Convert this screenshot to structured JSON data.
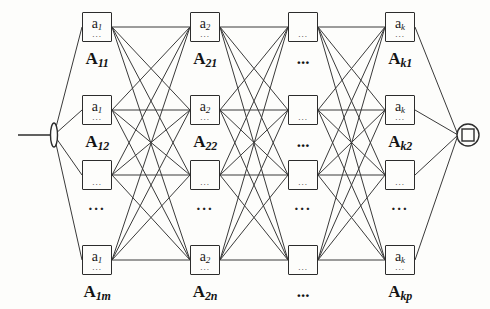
{
  "diagram": {
    "input_node": {
      "name": "input-node",
      "shape": "vertical-bar-with-lead-line"
    },
    "output_node": {
      "name": "output-node",
      "shape": "circle-with-square-inside"
    },
    "ellipsis": "...",
    "inner_box_dots": "...",
    "colors": {
      "stroke": "#2c2c2c",
      "wire": "#3a3a3a",
      "background": "#fdfdfb",
      "text": "#141414"
    },
    "columns": [
      {
        "index": 1,
        "nodes": [
          {
            "row": 1,
            "node_label": "a",
            "node_sub": "1",
            "group_label": "A",
            "group_sub": "11"
          },
          {
            "row": 2,
            "node_label": "a",
            "node_sub": "1",
            "group_label": "A",
            "group_sub": "12"
          },
          {
            "row": 3,
            "node_label": "",
            "node_sub": "",
            "group_label": "",
            "group_sub": ""
          },
          {
            "row": 4,
            "node_label": "a",
            "node_sub": "1",
            "group_label": "A",
            "group_sub": "1m"
          }
        ],
        "column_ellipsis": "..."
      },
      {
        "index": 2,
        "nodes": [
          {
            "row": 1,
            "node_label": "a",
            "node_sub": "2",
            "group_label": "A",
            "group_sub": "21"
          },
          {
            "row": 2,
            "node_label": "a",
            "node_sub": "2",
            "group_label": "A",
            "group_sub": "22"
          },
          {
            "row": 3,
            "node_label": "",
            "node_sub": "",
            "group_label": "",
            "group_sub": ""
          },
          {
            "row": 4,
            "node_label": "a",
            "node_sub": "2",
            "group_label": "A",
            "group_sub": "2n"
          }
        ],
        "column_ellipsis": "..."
      },
      {
        "index": 3,
        "nodes": [
          {
            "row": 1,
            "node_label": "",
            "node_sub": "",
            "group_label": "...",
            "group_sub": ""
          },
          {
            "row": 2,
            "node_label": "",
            "node_sub": "",
            "group_label": "...",
            "group_sub": ""
          },
          {
            "row": 3,
            "node_label": "",
            "node_sub": "",
            "group_label": "",
            "group_sub": ""
          },
          {
            "row": 4,
            "node_label": "",
            "node_sub": "",
            "group_label": "...",
            "group_sub": ""
          }
        ],
        "column_ellipsis": "..."
      },
      {
        "index": 4,
        "nodes": [
          {
            "row": 1,
            "node_label": "a",
            "node_sub": "k",
            "group_label": "A",
            "group_sub": "k1"
          },
          {
            "row": 2,
            "node_label": "a",
            "node_sub": "k",
            "group_label": "A",
            "group_sub": "k2"
          },
          {
            "row": 3,
            "node_label": "",
            "node_sub": "",
            "group_label": "",
            "group_sub": ""
          },
          {
            "row": 4,
            "node_label": "a",
            "node_sub": "k",
            "group_label": "A",
            "group_sub": "kp"
          }
        ],
        "column_ellipsis": "..."
      }
    ]
  }
}
